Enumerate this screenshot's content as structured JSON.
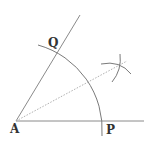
{
  "diagram": {
    "points": {
      "A": {
        "label": "A",
        "x": 16,
        "y": 121
      },
      "P": {
        "label": "P",
        "x": 104,
        "y": 121
      },
      "Q": {
        "label": "Q",
        "x": 58,
        "y": 49
      }
    },
    "colors": {
      "line": "#8a8a8a",
      "arc": "#7a7a7a",
      "bisector": "#b0b0b0",
      "label": "#333333",
      "background": "#ffffff"
    }
  }
}
